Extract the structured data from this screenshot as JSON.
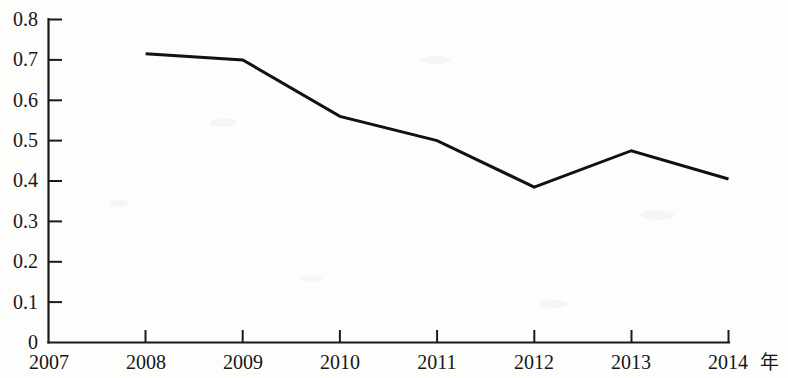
{
  "chart_data": {
    "type": "line",
    "title": "",
    "subtitle": "",
    "xlabel": "年",
    "ylabel": "",
    "x": [
      2007,
      2008,
      2009,
      2010,
      2011,
      2012,
      2013,
      2014
    ],
    "categories": [
      "2007",
      "2008",
      "2009",
      "2010",
      "2011",
      "2012",
      "2013",
      "2014"
    ],
    "series": [
      {
        "name": "",
        "x": [
          2008,
          2009,
          2010,
          2011,
          2012,
          2013,
          2014
        ],
        "values": [
          0.715,
          0.7,
          0.56,
          0.5,
          0.385,
          0.475,
          0.405
        ]
      }
    ],
    "xlim": [
      2007,
      2014
    ],
    "ylim": [
      0,
      0.8
    ],
    "ytick_values": [
      0,
      0.1,
      0.2,
      0.3,
      0.4,
      0.5,
      0.6,
      0.7,
      0.8
    ],
    "ytick_labels": [
      "0",
      "0.1",
      "0.2",
      "0.3",
      "0.4",
      "0.5",
      "0.6",
      "0.7",
      "0.8"
    ],
    "xtick_labels": [
      "2007",
      "2008",
      "2009",
      "2010",
      "2011",
      "2012",
      "2013",
      "2014"
    ],
    "grid": false,
    "legend": false,
    "legend_position": "none",
    "line_color": "#111111",
    "axis_color": "#1a1a1a",
    "background_color": "#fdfdfc",
    "annotations": []
  },
  "axis": {
    "x_unit_label": "年"
  }
}
